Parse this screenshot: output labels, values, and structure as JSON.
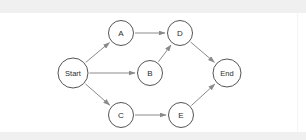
{
  "canvas": {
    "width": 306,
    "height": 140,
    "background_color": "#ffffff",
    "band_color": "#f0f0f1",
    "node_fill": "#ffffff",
    "node_stroke": "#555555",
    "edge_color": "#8a8a8a",
    "label_color": "#2b2b2b"
  },
  "diagram": {
    "type": "directed-graph",
    "title": "",
    "nodes": [
      {
        "id": "start",
        "label": "Start",
        "cx": 73,
        "cy": 73,
        "r": 15,
        "shape": "circle"
      },
      {
        "id": "a",
        "label": "A",
        "cx": 121,
        "cy": 33,
        "r": 12.5,
        "shape": "circle"
      },
      {
        "id": "b",
        "label": "B",
        "cx": 150,
        "cy": 73,
        "r": 12.5,
        "shape": "circle"
      },
      {
        "id": "c",
        "label": "C",
        "cx": 121,
        "cy": 115,
        "r": 12.5,
        "shape": "circle"
      },
      {
        "id": "d",
        "label": "D",
        "cx": 180,
        "cy": 33,
        "r": 12.5,
        "shape": "circle"
      },
      {
        "id": "e",
        "label": "E",
        "cx": 181,
        "cy": 115,
        "r": 12.5,
        "shape": "circle"
      },
      {
        "id": "end",
        "label": "End",
        "cx": 227,
        "cy": 73,
        "r": 14,
        "shape": "circle"
      }
    ],
    "edges": [
      {
        "id": "start-a",
        "from": "start",
        "to": "a",
        "label": "",
        "directed": true
      },
      {
        "id": "start-b",
        "from": "start",
        "to": "b",
        "label": "",
        "directed": true
      },
      {
        "id": "start-c",
        "from": "start",
        "to": "c",
        "label": "",
        "directed": true
      },
      {
        "id": "a-d",
        "from": "a",
        "to": "d",
        "label": "",
        "directed": true
      },
      {
        "id": "b-d",
        "from": "b",
        "to": "d",
        "label": "",
        "directed": true
      },
      {
        "id": "c-e",
        "from": "c",
        "to": "e",
        "label": "",
        "directed": true
      },
      {
        "id": "d-end",
        "from": "d",
        "to": "end",
        "label": "",
        "directed": true
      },
      {
        "id": "e-end",
        "from": "e",
        "to": "end",
        "label": "",
        "directed": true
      }
    ]
  }
}
